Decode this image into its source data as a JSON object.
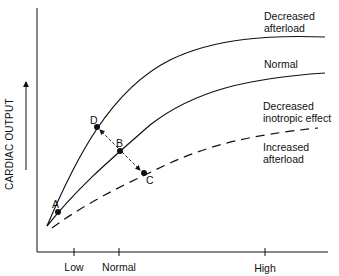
{
  "diagram": {
    "y_axis_label": "CARDIAC OUTPUT",
    "x_axis_ticks": [
      {
        "label": "Low",
        "x": 74
      },
      {
        "label": "Normal",
        "x": 119
      },
      {
        "label": "High",
        "x": 265
      }
    ],
    "curves": [
      {
        "id": "decreased-afterload",
        "label_line1": "Decreased",
        "label_line2": "afterload",
        "style": "solid"
      },
      {
        "id": "normal",
        "label_line1": "Normal",
        "style": "solid"
      },
      {
        "id": "decreased-inotropic",
        "label_line1": "Decreased",
        "label_line2": "inotropic effect",
        "style": "dashed"
      },
      {
        "id": "increased-afterload",
        "label_line1": "Increased",
        "label_line2": "afterload",
        "style": "dashed"
      }
    ],
    "points": [
      {
        "label": "A"
      },
      {
        "label": "B"
      },
      {
        "label": "C"
      },
      {
        "label": "D"
      }
    ],
    "colors": {
      "line": "#111111",
      "background": "#ffffff"
    }
  }
}
